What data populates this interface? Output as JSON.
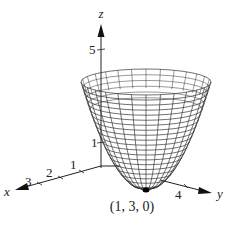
{
  "figure": {
    "axes": {
      "x": {
        "label": "x",
        "ticks": [
          "1",
          "2",
          "3"
        ]
      },
      "y": {
        "label": "y",
        "ticks": [
          "4"
        ]
      },
      "z": {
        "label": "z",
        "ticks": [
          "1",
          "5"
        ]
      }
    },
    "vertex_label": "(1, 3, 0)",
    "colors": {
      "line": "#222222",
      "background": "#ffffff"
    }
  }
}
